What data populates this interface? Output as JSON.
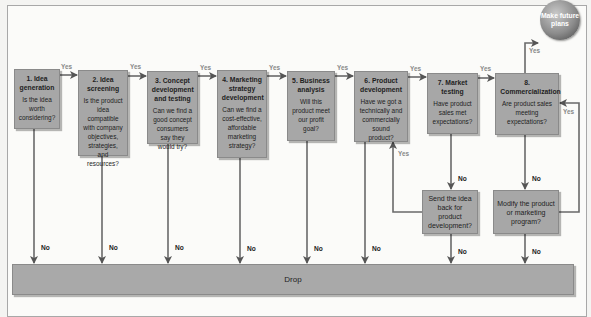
{
  "diagram": {
    "type": "flowchart",
    "stages": [
      {
        "number": "1.",
        "title": "1. Idea generation",
        "title_lines": [
          "1. Idea",
          "generation"
        ],
        "question": "Is the idea worth considering?"
      },
      {
        "number": "2.",
        "title": "2. Idea screening",
        "title_lines": [
          "2. Idea",
          "screening"
        ],
        "question": "Is the product idea compatible with company objectives, strategies, and resources?"
      },
      {
        "number": "3.",
        "title": "3. Concept development and testing",
        "title_lines": [
          "3. Concept",
          "development",
          "and testing"
        ],
        "question": "Can we find a good concept consumers say they would try?"
      },
      {
        "number": "4.",
        "title": "4. Marketing strategy development",
        "title_lines": [
          "4. Marketing",
          "strategy",
          "development"
        ],
        "question": "Can we find a cost-effective, affordable marketing strategy?"
      },
      {
        "number": "5.",
        "title": "5. Business analysis",
        "title_lines": [
          "5. Business",
          "analysis"
        ],
        "question": "Will this product meet our profit goal?"
      },
      {
        "number": "6.",
        "title": "6. Product development",
        "title_lines": [
          "6. Product",
          "development"
        ],
        "question": "Have we got a technically and commercially sound product?"
      },
      {
        "number": "7.",
        "title": "7. Market testing",
        "title_lines": [
          "7. Market",
          "testing"
        ],
        "question": "Have product sales met expectations?"
      },
      {
        "number": "8.",
        "title": "8. Commercialization",
        "title_lines": [
          "8.",
          "Commercialization"
        ],
        "question": "Are product sales meeting expectations?"
      }
    ],
    "side_boxes": [
      {
        "text": "Send the idea back for product development?"
      },
      {
        "text": "Modify the product or marketing program?"
      }
    ],
    "end_node": {
      "text": "Make future plans"
    },
    "drop_bar": {
      "text": "Drop"
    },
    "edge_labels": {
      "yes": "Yes",
      "no": "No"
    }
  }
}
